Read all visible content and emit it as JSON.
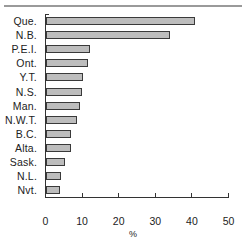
{
  "chart_data": {
    "type": "bar",
    "orientation": "horizontal",
    "title": "",
    "xlabel": "%",
    "ylabel": "",
    "categories": [
      "Que.",
      "N.B.",
      "P.E.I.",
      "Ont.",
      "Y.T.",
      "N.S.",
      "Man.",
      "N.W.T.",
      "B.C.",
      "Alta.",
      "Sask.",
      "N.L.",
      "Nvt."
    ],
    "values": [
      40.7,
      34.0,
      12.0,
      11.5,
      10.2,
      9.9,
      9.3,
      8.5,
      6.9,
      6.9,
      5.2,
      4.2,
      3.8
    ],
    "xlim": [
      0,
      50
    ],
    "xticks": [
      0,
      10,
      20,
      30,
      40,
      50
    ],
    "xtick_labels": [
      "0",
      "10",
      "20",
      "30",
      "40",
      "50"
    ],
    "grid": false,
    "legend": null,
    "colors": {
      "bar_fill": "#bdbdbd",
      "bar_edge": "#3a3a3a",
      "axis": "#333333",
      "top_rule": "#9a9a9a"
    }
  }
}
